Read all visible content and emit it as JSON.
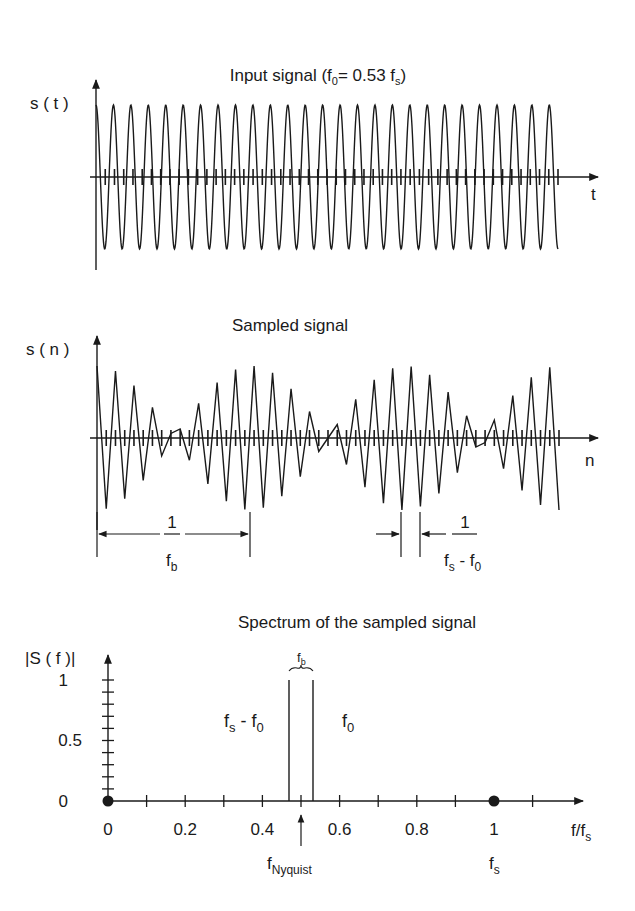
{
  "colors": {
    "ink": "#1a1a1a",
    "background": "#ffffff"
  },
  "panel_top": {
    "title_main": "Input signal (f",
    "title_sub0": "0",
    "title_mid": "= 0.53 f",
    "title_subs": "s",
    "title_end": ")",
    "ylabel": "s ( t )",
    "xlabel": "t"
  },
  "panel_middle": {
    "title": "Sampled signal",
    "ylabel": "s ( n )",
    "xlabel": "n",
    "beat_period_label": {
      "numerator": "1",
      "denominator_main": "f",
      "denominator_sub": "b"
    },
    "alias_period_label": {
      "numerator": "1",
      "den_f1": "f",
      "den_s": "s",
      "den_minus": " - f",
      "den_0": "0"
    }
  },
  "panel_bottom": {
    "title": "Spectrum of the sampled signal",
    "ylabel": "|S ( f )|",
    "xlabel_main": "f/f",
    "xlabel_sub": "s",
    "line_left_label": {
      "main": "f",
      "sub": "s",
      "rest": " - f",
      "sub2": "0"
    },
    "line_right_label": {
      "main": "f",
      "sub": "0"
    },
    "bracket_label": {
      "main": "f",
      "sub": "b"
    },
    "nyquist_label": {
      "main": "f",
      "sub": "Nyquist"
    },
    "fs_label": {
      "main": "f",
      "sub": "s"
    }
  },
  "chart_data": [
    {
      "type": "line",
      "title": "Input signal (f0= 0.53 fs)",
      "xlabel": "t",
      "ylabel": "s(t)",
      "signal": "cos(2*pi*0.53*n)",
      "f0_over_fs": 0.53,
      "num_samples": 50,
      "amplitude": 1,
      "sample_ticks": true
    },
    {
      "type": "line",
      "title": "Sampled signal",
      "xlabel": "n",
      "ylabel": "s(n)",
      "signal": "cos(2*pi*0.53*n) sampled at integer n, linear interpolation",
      "f0_over_fs": 0.53,
      "num_samples": 50,
      "annotations": [
        "1/fb (beat period)",
        "1/(fs - f0)"
      ]
    },
    {
      "type": "bar",
      "title": "Spectrum of the sampled signal",
      "xlabel": "f/fs",
      "ylabel": "|S(f)|",
      "x": [
        0.47,
        0.53
      ],
      "values": [
        1,
        1
      ],
      "x_ticks": [
        0,
        0.2,
        0.4,
        0.6,
        0.8,
        1
      ],
      "y_ticks": [
        0,
        0.5,
        1
      ],
      "xlim": [
        0,
        1.2
      ],
      "ylim": [
        0,
        1.1
      ],
      "markers": [
        {
          "x": 0,
          "label": "dot"
        },
        {
          "x": 1,
          "label": "fs"
        }
      ],
      "annotations": [
        "fs - f0 at 0.47",
        "f0 at 0.53",
        "fb bracket",
        "fNyquist at 0.5"
      ]
    }
  ]
}
